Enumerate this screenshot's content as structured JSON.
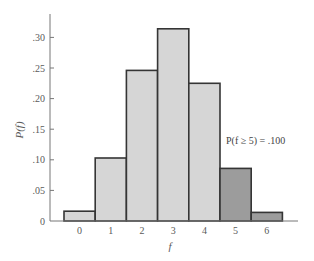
{
  "chart_data": {
    "type": "bar",
    "title": "",
    "xlabel": "f",
    "ylabel": "P(f)",
    "categories": [
      "0",
      "1",
      "2",
      "3",
      "4",
      "5",
      "6"
    ],
    "values": [
      0.016,
      0.103,
      0.246,
      0.314,
      0.225,
      0.086,
      0.014
    ],
    "highlighted_categories": [
      "5",
      "6"
    ],
    "ylim": [
      0,
      0.33
    ],
    "yticks": [
      0,
      0.05,
      0.1,
      0.15,
      0.2,
      0.25,
      0.3
    ],
    "ytick_labels": [
      "0",
      ".05",
      ".10",
      ".15",
      ".20",
      ".25",
      ".30"
    ],
    "grid": false,
    "legend": null,
    "annotations": [
      "P(f ≥ 5) = .100"
    ]
  },
  "colors": {
    "bar_fill": "#d6d6d6",
    "bar_highlight_fill": "#9c9c9c",
    "bar_outline": "#353535",
    "axis": "#777777"
  },
  "annotation": {
    "text": "P(f ≥ 5) = .100"
  }
}
